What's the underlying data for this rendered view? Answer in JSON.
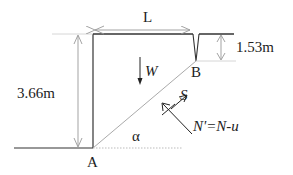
{
  "diagram": {
    "type": "slope-stability-wedge",
    "labels": {
      "length": "L",
      "wall_height": "3.66m",
      "crack_depth": "1.53m",
      "weight": "W",
      "shear": "S",
      "normal": "N'=N-u",
      "angle": "α",
      "point_a": "A",
      "point_b": "B"
    },
    "colors": {
      "structure": "#333333",
      "dimension": "#999999",
      "slip_line": "#aaaaaa",
      "text": "#222222"
    }
  }
}
